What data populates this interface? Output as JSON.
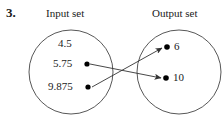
{
  "problem": {
    "number": "3."
  },
  "diagram": {
    "type": "mapping-diagram",
    "sets": [
      {
        "id": "input",
        "label": "Input set",
        "side": "left",
        "circle": {
          "cx": 71,
          "cy": 72,
          "r": 42
        },
        "elements": [
          {
            "value": "4.5",
            "has_dot": false,
            "x": 68,
            "y": 44
          },
          {
            "value": "5.75",
            "has_dot": true,
            "dot_x": 87,
            "dot_y": 64
          },
          {
            "value": "9.875",
            "has_dot": true,
            "dot_x": 88,
            "dot_y": 87
          }
        ]
      },
      {
        "id": "output",
        "label": "Output set",
        "side": "right",
        "circle": {
          "cx": 179,
          "cy": 72,
          "r": 42
        },
        "elements": [
          {
            "value": "6",
            "has_dot": true,
            "dot_x": 167,
            "dot_y": 47
          },
          {
            "value": "10",
            "has_dot": true,
            "dot_x": 166,
            "dot_y": 78
          }
        ]
      }
    ],
    "mappings": [
      {
        "from": "5.75",
        "to": "10",
        "x1": 90,
        "y1": 64,
        "x2": 161,
        "y2": 78
      },
      {
        "from": "9.875",
        "to": "6",
        "x1": 92,
        "y1": 87,
        "x2": 162,
        "y2": 48
      }
    ],
    "stroke_color": "#333333",
    "dot_color": "#000000",
    "background_color": "#ffffff"
  }
}
